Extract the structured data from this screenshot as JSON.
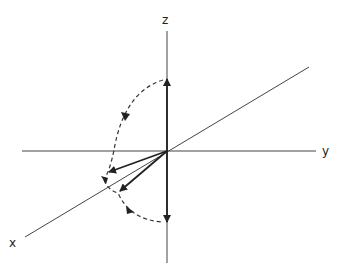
{
  "diagram": {
    "axes": [
      {
        "name": "z",
        "label": "z"
      },
      {
        "name": "y",
        "label": "y"
      },
      {
        "name": "x",
        "label": "x"
      }
    ],
    "vectors": [
      {
        "name": "vector-up",
        "direction": "+z"
      },
      {
        "name": "vector-tilted-1",
        "direction": "toward -y/+x"
      },
      {
        "name": "vector-tilted-2",
        "direction": "toward +x"
      },
      {
        "name": "vector-down",
        "direction": "-z"
      }
    ],
    "arcs": [
      {
        "name": "rotation-arc-upper",
        "style": "dashed",
        "from": "+z",
        "to": "x-y plane"
      },
      {
        "name": "rotation-arc-lower",
        "style": "dashed",
        "from": "x-y plane",
        "to": "-z"
      }
    ],
    "colors": {
      "line": "#333333",
      "background": "#ffffff"
    }
  }
}
